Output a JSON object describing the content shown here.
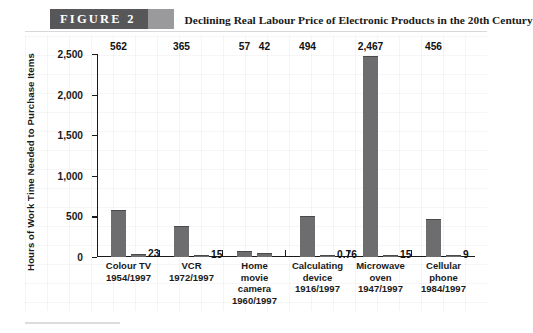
{
  "header": {
    "figure_label": "FIGURE   2",
    "title": "Declining Real Labour Price of Electronic Products in the 20th Century"
  },
  "chart_data": {
    "type": "bar",
    "title": "Declining Real Labour Price of Electronic Products in the 20th Century",
    "xlabel": "",
    "ylabel": "Hours of Work Time Needed to Purchase Items",
    "ylim": [
      0,
      2500
    ],
    "yticks": [
      "0",
      "500",
      "1,000",
      "1,500",
      "2,000",
      "2,500"
    ],
    "ytick_values": [
      0,
      500,
      1000,
      1500,
      2000,
      2500
    ],
    "grid": false,
    "legend": "none",
    "categories": [
      "Colour TV\n1954/1997",
      "VCR\n1972/1997",
      "Home\nmovie\ncamera\n1960/1997",
      "Calculating\ndevice\n1916/1997",
      "Microwave\noven\n1947/1997",
      "Cellular\nphone\n1984/1997"
    ],
    "series": [
      {
        "name": "Earlier year",
        "values": [
          562,
          365,
          57,
          494,
          2467,
          456
        ]
      },
      {
        "name": "1997",
        "values": [
          23,
          15,
          42,
          0.76,
          15,
          9
        ]
      }
    ],
    "groups": [
      {
        "name": "Colour TV",
        "label_lines": [
          "Colour TV",
          "1954/1997"
        ],
        "bars": [
          {
            "value": 562,
            "label": "562",
            "label_pos": "top"
          },
          {
            "value": 23,
            "label": "23",
            "label_pos": "right"
          }
        ]
      },
      {
        "name": "VCR",
        "label_lines": [
          "VCR",
          "1972/1997"
        ],
        "bars": [
          {
            "value": 365,
            "label": "365",
            "label_pos": "top"
          },
          {
            "value": 15,
            "label": "15",
            "label_pos": "right"
          }
        ]
      },
      {
        "name": "Home movie camera",
        "label_lines": [
          "Home",
          "movie",
          "camera",
          "1960/1997"
        ],
        "bars": [
          {
            "value": 57,
            "label": "57",
            "label_pos": "top"
          },
          {
            "value": 42,
            "label": "42",
            "label_pos": "top"
          }
        ]
      },
      {
        "name": "Calculating device",
        "label_lines": [
          "Calculating",
          "device",
          "1916/1997"
        ],
        "bars": [
          {
            "value": 494,
            "label": "494",
            "label_pos": "top"
          },
          {
            "value": 0.76,
            "label": "0.76",
            "label_pos": "right"
          }
        ]
      },
      {
        "name": "Microwave oven",
        "label_lines": [
          "Microwave",
          "oven",
          "1947/1997"
        ],
        "bars": [
          {
            "value": 2467,
            "label": "2,467",
            "label_pos": "top"
          },
          {
            "value": 15,
            "label": "15",
            "label_pos": "right"
          }
        ]
      },
      {
        "name": "Cellular phone",
        "label_lines": [
          "Cellular",
          "phone",
          "1984/1997"
        ],
        "bars": [
          {
            "value": 456,
            "label": "456",
            "label_pos": "top"
          },
          {
            "value": 9,
            "label": "9",
            "label_pos": "right"
          }
        ]
      }
    ],
    "colors": {
      "bar": "#6d6d70",
      "axis": "#1a1a1a",
      "text": "#1a1a1a",
      "band": "#57575a",
      "band_accent": "#b9b9bb",
      "background": "#ffffff"
    }
  }
}
